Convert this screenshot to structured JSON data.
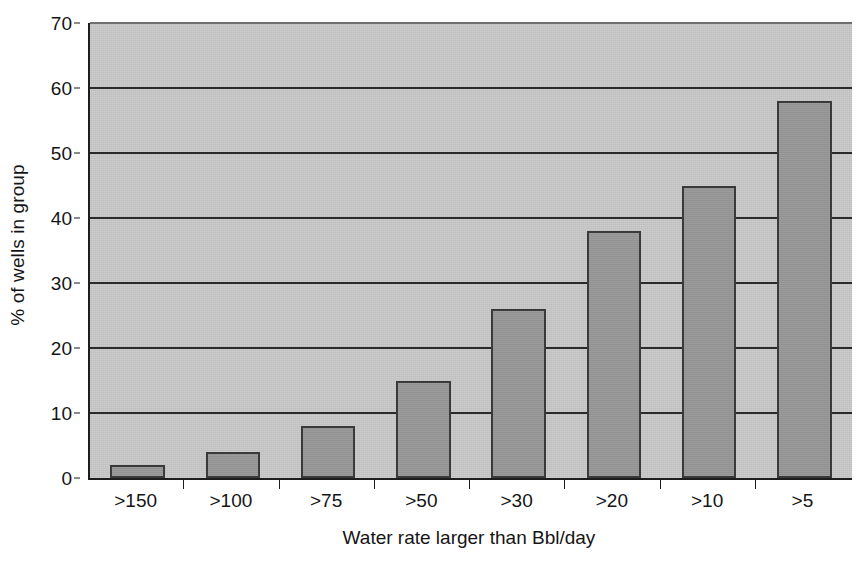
{
  "chart_data": {
    "type": "bar",
    "title": "",
    "subtitle": "",
    "xlabel": "Water rate larger than Bbl/day",
    "ylabel": "% of wells in group",
    "categories": [
      ">150",
      ">100",
      ">75",
      ">50",
      ">30",
      ">20",
      ">10",
      ">5"
    ],
    "values": [
      2,
      4,
      8,
      15,
      26,
      38,
      45,
      58
    ],
    "ylim": [
      0,
      70
    ],
    "ytick_step": 10,
    "yticks": [
      0,
      10,
      20,
      30,
      40,
      50,
      60,
      70
    ],
    "ytick_labels": [
      "0",
      "10",
      "20",
      "30",
      "40",
      "50",
      "60",
      "70"
    ],
    "grid": true,
    "grid_axis": "y",
    "legend": false,
    "legend_position": "none",
    "series": [
      {
        "name": "% of wells in group",
        "values": [
          2,
          4,
          8,
          15,
          26,
          38,
          45,
          58
        ]
      }
    ],
    "colors": {
      "bar_fill": "#979797",
      "bar_border": "#3a3a3a",
      "plot_background": "#c9c9c9",
      "gridline": "#2a2a2a",
      "axis": "#1d1d1d",
      "page_background": "#ffffff",
      "text": "#151515"
    }
  }
}
